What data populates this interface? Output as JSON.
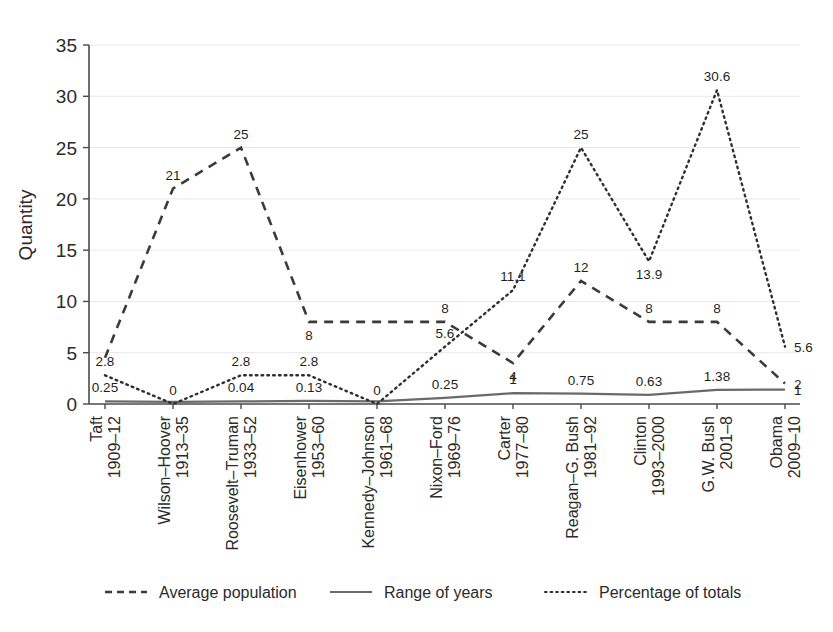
{
  "chart_data": {
    "type": "line",
    "title": "",
    "xlabel": "",
    "ylabel": "Quantity",
    "ylim": [
      0,
      35
    ],
    "yticks": [
      0,
      5,
      10,
      15,
      20,
      25,
      30,
      35
    ],
    "grid": true,
    "legend_position": "bottom",
    "categories": [
      "Taft 1909–12",
      "Wilson–Hoover 1913–35",
      "Roosevelt–Truman 1933–52",
      "Eisenhower 1953–60",
      "Kennedy–Johnson 1961–68",
      "Nixon–Ford 1969–76",
      "Carter 1977–80",
      "Reagan–G. Bush 1981–92",
      "Clinton 1993–2000",
      "G.W. Bush 2001–8",
      "Obama 2009–10"
    ],
    "category_lines": [
      [
        "Taft",
        "1909–12"
      ],
      [
        "Wilson–Hoover",
        "1913–35"
      ],
      [
        "Roosevelt–Truman",
        "1933–52"
      ],
      [
        "Eisenhower",
        "1953–60"
      ],
      [
        "Kennedy–Johnson",
        "1961–68"
      ],
      [
        "Nixon–Ford",
        "1969–76"
      ],
      [
        "Carter",
        "1977–80"
      ],
      [
        "Reagan–G. Bush",
        "1981–92"
      ],
      [
        "Clinton",
        "1993–2000"
      ],
      [
        "G.W. Bush",
        "2001–8"
      ],
      [
        "Obama",
        "2009–10"
      ]
    ],
    "series": [
      {
        "name": "Average population",
        "style": "dashed",
        "color": "#3b3b3b",
        "values": [
          4.5,
          21,
          25,
          8,
          8,
          8,
          4,
          12,
          8,
          8,
          2
        ],
        "labels": [
          "",
          "21",
          "25",
          "8",
          "",
          "8",
          "4",
          "12",
          "8",
          "8",
          "2"
        ],
        "label_positions": [
          "",
          "above",
          "above",
          "below",
          "",
          "above",
          "below",
          "above",
          "above",
          "above",
          "right"
        ]
      },
      {
        "name": "Range of years",
        "style": "solid",
        "color": "#6a6a6a",
        "values": [
          0.25,
          0.2,
          0.25,
          0.3,
          0.25,
          0.6,
          1.05,
          1.0,
          0.9,
          1.38,
          1.4
        ],
        "labels": [
          "0.25",
          "",
          "0.04",
          "0.13",
          "",
          "0.25",
          "1",
          "0.75",
          "0.63",
          "1.38",
          "1"
        ],
        "label_positions": [
          "above",
          "",
          "above",
          "above",
          "",
          "above",
          "above",
          "above",
          "above",
          "above",
          "right"
        ]
      },
      {
        "name": "Percentage of totals",
        "style": "dotted",
        "color": "#2f2f2f",
        "values": [
          2.8,
          0,
          2.8,
          2.8,
          0,
          5.6,
          11.1,
          25,
          13.9,
          30.6,
          5.6
        ],
        "labels": [
          "2.8",
          "0",
          "2.8",
          "2.8",
          "0",
          "5.6",
          "11.1",
          "25",
          "13.9",
          "30.6",
          "5.6"
        ],
        "label_positions": [
          "above",
          "above",
          "above",
          "above",
          "above",
          "above",
          "above",
          "above",
          "below",
          "above",
          "right"
        ]
      }
    ]
  },
  "legend": {
    "items": [
      {
        "label": "Average population",
        "marker": "dashed-line-marker"
      },
      {
        "label": "Range of years",
        "marker": "solid-line-marker"
      },
      {
        "label": "Percentage of totals",
        "marker": "dotted-line-marker"
      }
    ]
  }
}
